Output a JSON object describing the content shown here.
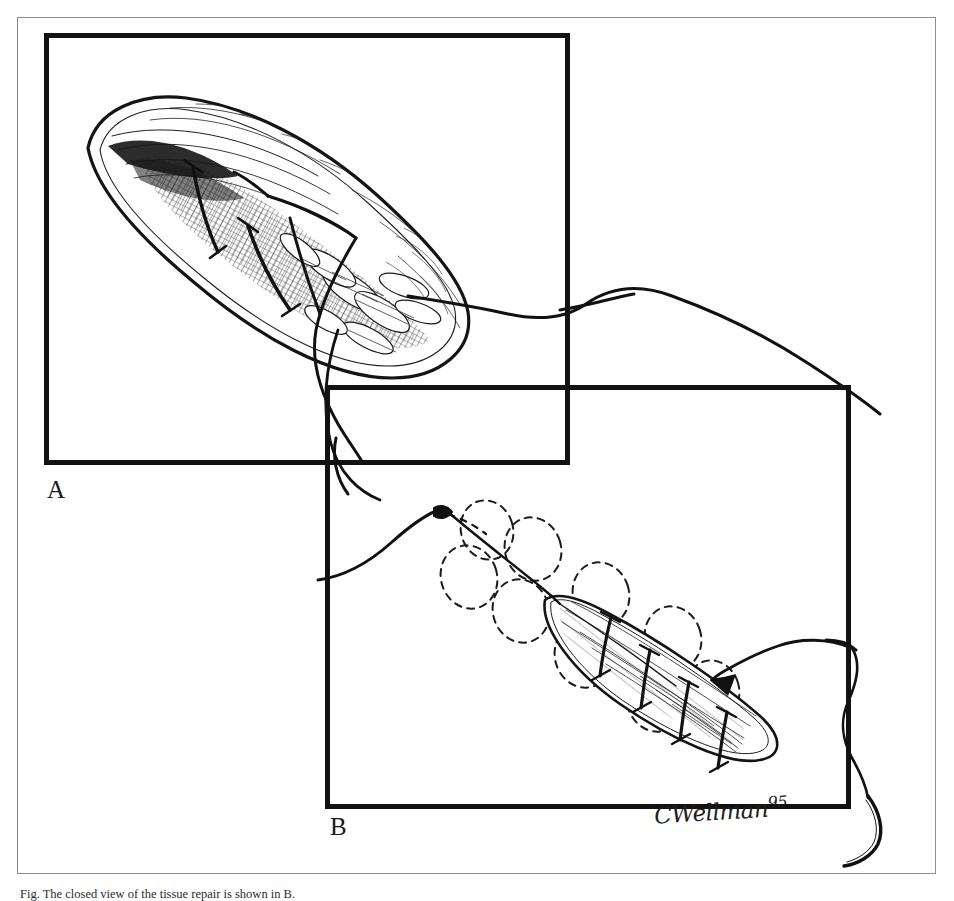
{
  "figure": {
    "kind": "surgical-illustration",
    "medium": "pen-and-ink line drawing",
    "background_color": "#ffffff",
    "ink_color": "#121212",
    "page_frame_color": "#8d8d8d",
    "panels": [
      {
        "id": "A",
        "label": "A",
        "subject": "Teardrop-shaped tissue flap shown in open view with cross-hatched shading, internal vessels and three heavy suture strands placed across the incision; a long suture tail trails out of the panel at the lower right.",
        "frame": {
          "x": 44,
          "y": 33,
          "width": 526,
          "height": 432
        }
      },
      {
        "id": "B",
        "label": "B",
        "subject": "Reduced, closed view of the same tissue shown on a diagonal with four transverse sutures tied; a chain of dashed clover-leaf loops traces the closure path, the suture thread enters from the left and a curved surgical needle hangs at the right with an arrow pointing back to the repair.",
        "frame": {
          "x": 325,
          "y": 385,
          "width": 526,
          "height": 424
        }
      }
    ],
    "signature": {
      "name": "CWellman",
      "year": "95"
    },
    "caption": "Fig. The closed view of the tissue repair is shown in B.",
    "caption_note": "caption line is cropped by the bottom edge of the image; only the tops of the letters are visible"
  }
}
